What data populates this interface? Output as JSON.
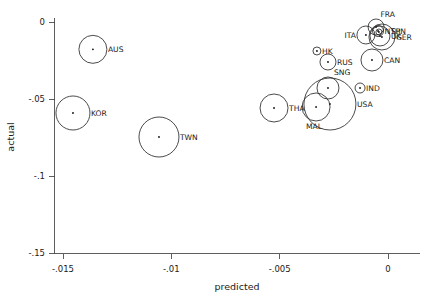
{
  "chart_data": {
    "type": "scatter",
    "title": "",
    "subtitle": "",
    "xlabel": "predicted",
    "ylabel": "actual",
    "xlim": [
      -0.0165,
      0.0007
    ],
    "ylim": [
      -0.1585,
      0.0045
    ],
    "xticks": [
      -0.015,
      -0.01,
      -0.005,
      0
    ],
    "xtick_labels": [
      "-.015",
      "-.01",
      "-.005",
      "0"
    ],
    "yticks": [
      0,
      -0.05,
      -0.1,
      -0.15
    ],
    "ytick_labels": [
      "0",
      "-.05",
      "-.1",
      "-.15"
    ],
    "grid": false,
    "legend": "none",
    "marker": "open-circle-with-center-dot",
    "size_encoding": "bubble area encodes relative magnitude",
    "points": [
      {
        "label": "AUS",
        "x": -0.01362,
        "y": -0.01775,
        "r": 14.0,
        "label_pos": "right"
      },
      {
        "label": "KOR",
        "x": -0.01454,
        "y": -0.05909,
        "r": 17.0,
        "label_pos": "right"
      },
      {
        "label": "TWN",
        "x": -0.01057,
        "y": -0.07468,
        "r": 20.0,
        "label_pos": "right"
      },
      {
        "label": "THA",
        "x": -0.00526,
        "y": -0.05584,
        "r": 14.0,
        "label_pos": "right"
      },
      {
        "label": "MAL",
        "x": -0.00332,
        "y": -0.05519,
        "r": 14.0,
        "label_pos": "below-left"
      },
      {
        "label": "USA",
        "x": -0.00268,
        "y": -0.05325,
        "r": 26.0,
        "label_pos": "right"
      },
      {
        "label": "SNG",
        "x": -0.00277,
        "y": -0.04286,
        "r": 11.0,
        "label_pos": "upper-right"
      },
      {
        "label": "RUS",
        "x": -0.00277,
        "y": -0.02597,
        "r": 8.0,
        "label_pos": "right"
      },
      {
        "label": "HK",
        "x": -0.00328,
        "y": -0.01883,
        "r": 4.0,
        "label_pos": "right"
      },
      {
        "label": "IND",
        "x": -0.00129,
        "y": -0.04286,
        "r": 5.0,
        "label_pos": "right"
      },
      {
        "label": "CAN",
        "x": -0.00074,
        "y": -0.02468,
        "r": 11.0,
        "label_pos": "right"
      },
      {
        "label": "ITA",
        "x": -0.00102,
        "y": -0.00844,
        "r": 9.0,
        "label_pos": "left"
      },
      {
        "label": "UK",
        "x": -0.00037,
        "y": -0.00909,
        "r": 10.0,
        "label_pos": "right"
      },
      {
        "label": "GER",
        "x": -0.00028,
        "y": -0.00974,
        "r": 13.0,
        "label_pos": "right"
      },
      {
        "label": "NTH",
        "x": -0.00046,
        "y": -0.00584,
        "r": 5.5,
        "label_pos": "right"
      },
      {
        "label": "SPN",
        "x": -0.00042,
        "y": -0.00649,
        "r": 3.0,
        "label_pos": "far-right"
      },
      {
        "label": "FRA",
        "x": -0.00055,
        "y": -0.00325,
        "r": 8.0,
        "label_pos": "upper-right"
      }
    ]
  },
  "axes": {
    "x_axis_name": "predicted",
    "y_axis_name": "actual"
  }
}
